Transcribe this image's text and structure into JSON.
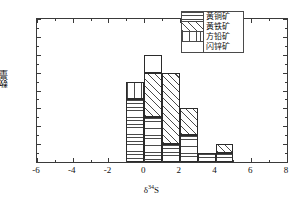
{
  "chart_data": {
    "type": "bar",
    "title": "",
    "subtitle": "",
    "xlabel": "δ³⁴S",
    "xlabel_base": "δ",
    "xlabel_sup": "34",
    "xlabel_tail": "S",
    "ylabel": "数量",
    "xlim": [
      -6,
      8
    ],
    "ylim": [
      0,
      16
    ],
    "xticks": [
      -6,
      -4,
      -2,
      0,
      2,
      4,
      6,
      8
    ],
    "xtick_labels": [
      "-6",
      "-4",
      "-2",
      "0",
      "2",
      "4",
      "6",
      "8"
    ],
    "xticks_minor": [
      -5,
      -3,
      -1,
      1,
      3,
      5,
      7
    ],
    "yticks": [
      0,
      2,
      4,
      6,
      8,
      10,
      12,
      14,
      16
    ],
    "ytick_labels": [
      "0",
      "2",
      "4",
      "6",
      "8",
      "10",
      "12",
      "14",
      "16"
    ],
    "yticks_minor": [
      1,
      3,
      5,
      7,
      9,
      11,
      13,
      15
    ],
    "grid": false,
    "stacked": true,
    "bin_width": 1,
    "bin_starts": [
      -1,
      0,
      1,
      2,
      3,
      4
    ],
    "bin_labels": [
      "-1 ~ 0",
      "0 ~ 1",
      "1 ~ 2",
      "2 ~ 3",
      "3 ~ 4",
      "4 ~ 5"
    ],
    "legend_position": "upper right",
    "series": [
      {
        "name": "黄铜矿",
        "pattern": "horizontal-lines",
        "values": [
          7,
          5,
          2,
          3,
          1,
          1
        ]
      },
      {
        "name": "黄铁矿",
        "pattern": "diagonal-hatch",
        "values": [
          0,
          5,
          8,
          3,
          0,
          1
        ]
      },
      {
        "name": "方铅矿",
        "pattern": "vertical-lines",
        "values": [
          2,
          0,
          0,
          0,
          0,
          0
        ]
      },
      {
        "name": "闪锌矿",
        "pattern": "blank",
        "values": [
          0,
          2,
          0,
          0,
          0,
          0
        ]
      }
    ],
    "totals": [
      9,
      12,
      10,
      6,
      1,
      2
    ]
  },
  "legend": {
    "items": [
      {
        "label": "黄铜矿",
        "pattern": "horizontal-lines"
      },
      {
        "label": "黄铁矿",
        "pattern": "diagonal-hatch"
      },
      {
        "label": "方铅矿",
        "pattern": "vertical-lines"
      },
      {
        "label": "闪锌矿",
        "pattern": "blank"
      }
    ]
  },
  "axes": {
    "y_title": "数量",
    "x_title_base": "δ",
    "x_title_sup": "34",
    "x_title_tail": "S"
  }
}
